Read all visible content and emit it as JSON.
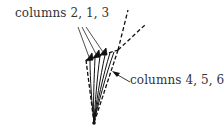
{
  "diagram": {
    "labels": {
      "top": "columns 2, 1, 3",
      "right": "columns 4, 5, 6"
    },
    "colors": {
      "ink": "#111111",
      "text": "#333333",
      "background": "#ffffff"
    },
    "elements": {
      "apex_point": [
        95,
        123
      ],
      "cone_edges": "dashed",
      "streamlines": "solid curves converging to apex",
      "arrows_top": "three leader lines from top label to column arrows",
      "arrow_right": "single leader arrow from right label to cone"
    }
  }
}
